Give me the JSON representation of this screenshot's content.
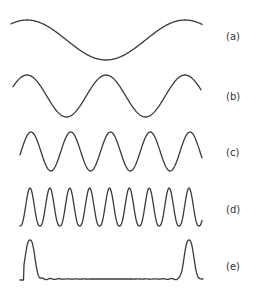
{
  "figure": {
    "stroke_color": "#3a3a3a",
    "background": "#ffffff",
    "waves": [
      {
        "label": "(a)",
        "label_y": 31,
        "x_start": 11,
        "x_end": 202,
        "baseline_y": 40,
        "amplitude": 20,
        "periods": 1.0,
        "phase_peak_x": 27,
        "period_px": 158,
        "shape": "sine"
      },
      {
        "label": "(b)",
        "label_y": 91,
        "x_start": 13,
        "x_end": 201,
        "baseline_y": 96,
        "amplitude": 21,
        "periods": 2.0,
        "phase_peak_x": 27,
        "period_px": 79,
        "shape": "sine"
      },
      {
        "label": "(c)",
        "label_y": 147,
        "x_start": 20,
        "x_end": 202,
        "baseline_y": 151.5,
        "amplitude": 19.5,
        "periods": 4.0,
        "phase_peak_x": 31,
        "period_px": 39.75,
        "shape": "sine"
      },
      {
        "label": "(d)",
        "label_y": 204,
        "x_start": 20,
        "x_end": 202,
        "baseline_y": 207,
        "amplitude": 19,
        "periods": 8.0,
        "phase_peak_x": 30,
        "period_px": 19.875,
        "shape": "sine-sharpened"
      },
      {
        "label": "(e)",
        "label_y": 261,
        "x_start": 20,
        "x_end": 203,
        "baseline_y": 279,
        "amplitude": 39,
        "peaks_x": [
          30,
          189
        ],
        "peak_half_width": 6,
        "shape": "pulse-train"
      }
    ]
  }
}
